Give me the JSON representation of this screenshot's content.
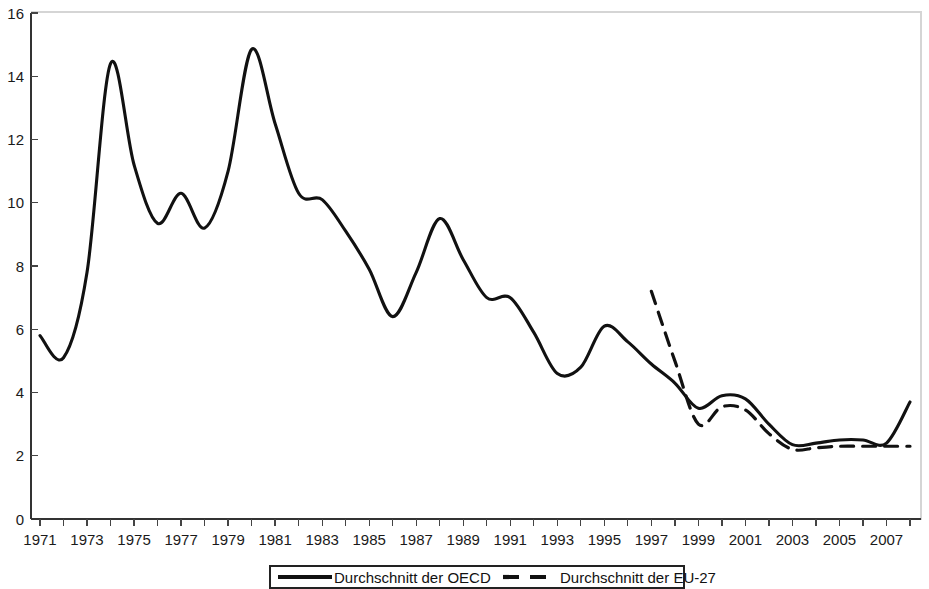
{
  "chart_data": {
    "type": "line",
    "title": "",
    "subtitle": "",
    "xlabel": "",
    "ylabel": "",
    "xlim": [
      1971,
      2008
    ],
    "ylim": [
      0,
      16
    ],
    "yticks": [
      0,
      2,
      4,
      6,
      8,
      10,
      12,
      14,
      16
    ],
    "ytick_labels": [
      "0",
      "2",
      "4",
      "6",
      "8",
      "10",
      "12",
      "14",
      "16"
    ],
    "xticks": [
      1971,
      1973,
      1975,
      1977,
      1979,
      1981,
      1983,
      1985,
      1987,
      1989,
      1991,
      1993,
      1995,
      1997,
      1999,
      2001,
      2003,
      2005,
      2007
    ],
    "xtick_labels": [
      "1971",
      "1973",
      "1975",
      "1977",
      "1979",
      "1981",
      "1983",
      "1985",
      "1987",
      "1989",
      "1991",
      "1993",
      "1995",
      "1997",
      "1999",
      "2001",
      "2003",
      "2005",
      "2007"
    ],
    "minor_xticks_every": 1,
    "grid": false,
    "legend_position": "bottom",
    "line_color": "#111111",
    "series": [
      {
        "name": "Durchschnitt der OECD",
        "style": "solid",
        "x": [
          1971,
          1972,
          1973,
          1974,
          1975,
          1976,
          1977,
          1978,
          1979,
          1980,
          1981,
          1982,
          1983,
          1984,
          1985,
          1986,
          1987,
          1988,
          1989,
          1990,
          1991,
          1992,
          1993,
          1994,
          1995,
          1996,
          1997,
          1998,
          1999,
          2000,
          2001,
          2002,
          2003,
          2004,
          2005,
          2006,
          2007,
          2008
        ],
        "values": [
          5.8,
          5.1,
          7.8,
          14.4,
          11.2,
          9.35,
          10.3,
          9.2,
          11.0,
          14.85,
          12.5,
          10.3,
          10.1,
          9.1,
          7.9,
          6.4,
          7.8,
          9.5,
          8.2,
          7.0,
          7.0,
          5.9,
          4.6,
          4.8,
          6.1,
          5.6,
          4.9,
          4.3,
          3.5,
          3.9,
          3.8,
          3.0,
          2.35,
          2.4,
          2.5,
          2.5,
          2.4,
          3.7
        ]
      },
      {
        "name": "Durchschnitt der EU-27",
        "style": "dashed",
        "x": [
          1997,
          1998,
          1999,
          2000,
          2001,
          2002,
          2003,
          2004,
          2005,
          2006,
          2007,
          2008
        ],
        "values": [
          7.2,
          5.0,
          3.0,
          3.55,
          3.45,
          2.7,
          2.2,
          2.25,
          2.3,
          2.3,
          2.3,
          2.3
        ]
      }
    ],
    "legend": [
      {
        "label": "Durchschnitt der OECD",
        "style": "solid"
      },
      {
        "label": "Durchschnitt der EU-27",
        "style": "dashed"
      }
    ]
  }
}
